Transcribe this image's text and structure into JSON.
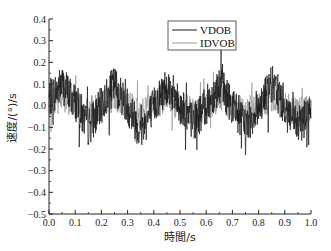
{
  "chart_data": {
    "type": "line",
    "title": "",
    "xlabel": "時間/s",
    "ylabel": "速度/(°)/s",
    "xlim": [
      0.0,
      1.0
    ],
    "ylim": [
      -0.5,
      0.4
    ],
    "xticks": [
      "0.0",
      "0.1",
      "0.2",
      "0.3",
      "0.4",
      "0.5",
      "0.6",
      "0.7",
      "0.8",
      "0.9",
      "1.0"
    ],
    "yticks": [
      "0.4",
      "0.3",
      "0.2",
      "0.1",
      "0.0",
      "-0.1",
      "-0.2",
      "-0.3",
      "-0.4",
      "-0.5"
    ],
    "grid": false,
    "legend_position": "upper center",
    "series": [
      {
        "name": "VDOB",
        "color": "#1a1a1a",
        "description": "sinusoid with noise, period ~0.2 s, amplitude ~0.1, noise spikes up to ~0.3 / down to ~-0.37",
        "x": [
          0.0,
          0.05,
          0.1,
          0.15,
          0.2,
          0.25,
          0.3,
          0.35,
          0.4,
          0.45,
          0.5,
          0.55,
          0.6,
          0.65,
          0.7,
          0.75,
          0.8,
          0.85,
          0.9,
          0.95,
          1.0
        ],
        "values": [
          0.03,
          0.1,
          0.02,
          -0.1,
          0.0,
          0.1,
          0.0,
          -0.12,
          0.0,
          0.1,
          0.0,
          -0.08,
          0.0,
          0.1,
          0.0,
          -0.1,
          0.0,
          0.1,
          0.0,
          -0.1,
          -0.02
        ],
        "peak_max": 0.31,
        "peak_min": -0.37
      },
      {
        "name": "IDVOB",
        "color": "#9a9a9a",
        "description": "lower-amplitude oscillation around zero with noise",
        "x": [
          0.0,
          0.05,
          0.1,
          0.15,
          0.2,
          0.25,
          0.3,
          0.35,
          0.4,
          0.45,
          0.5,
          0.55,
          0.6,
          0.65,
          0.7,
          0.75,
          0.8,
          0.85,
          0.9,
          0.95,
          1.0
        ],
        "values": [
          0.01,
          0.04,
          0.01,
          -0.03,
          0.0,
          0.04,
          0.0,
          -0.04,
          0.0,
          0.04,
          0.0,
          -0.03,
          0.0,
          0.04,
          0.0,
          -0.03,
          0.0,
          0.04,
          0.0,
          -0.03,
          0.0
        ],
        "peak_max": 0.28,
        "peak_min": -0.2
      }
    ]
  }
}
